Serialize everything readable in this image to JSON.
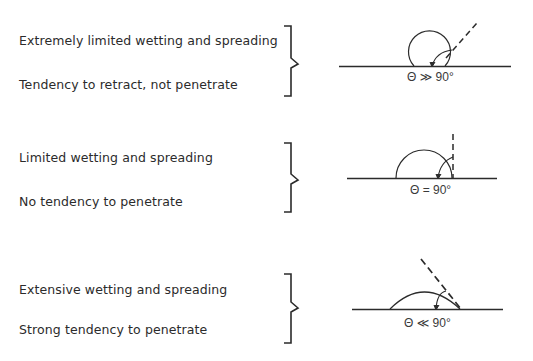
{
  "rows": [
    {
      "line1": "Extremely limited wetting and spreading",
      "line2": "Tendency to retract, not penetrate",
      "angle_label": "Θ ≫ 90°",
      "contact_angle": "much greater than 90 degrees"
    },
    {
      "line1": "Limited wetting and spreading",
      "line2": "No tendency to penetrate",
      "angle_label": "Θ  = 90°",
      "contact_angle": "equal to 90 degrees"
    },
    {
      "line1": "Extensive wetting and spreading",
      "line2": "Strong tendency to penetrate",
      "angle_label": "Θ ≪ 90°",
      "contact_angle": "much less than 90 degrees"
    }
  ],
  "colors": {
    "ink": "#2b2b2b",
    "background": "#ffffff"
  }
}
